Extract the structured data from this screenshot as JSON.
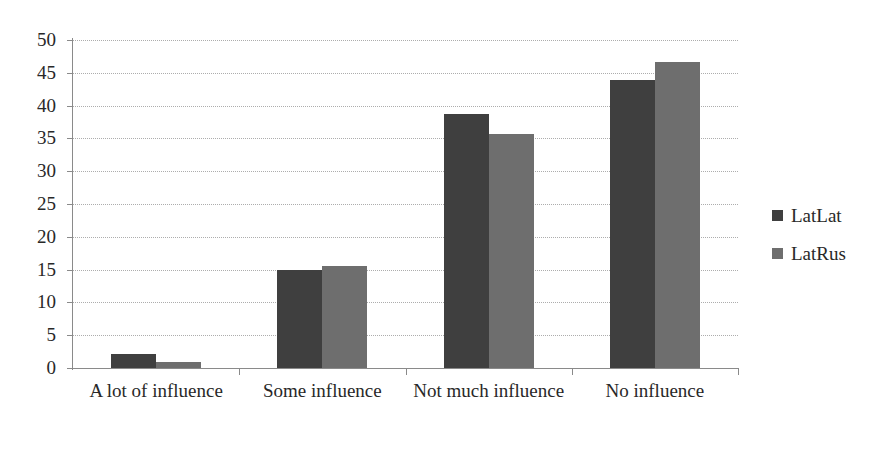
{
  "chart_data": {
    "type": "bar",
    "title": "",
    "subtitle": "",
    "xlabel": "",
    "ylabel": "",
    "categories": [
      "A lot of influence",
      "Some influence",
      "Not much influence",
      "No influence"
    ],
    "series": [
      {
        "name": "LatLat",
        "color": "#3f3f3f",
        "values": [
          2.1,
          15.0,
          38.7,
          43.9
        ]
      },
      {
        "name": "LatRus",
        "color": "#6e6e6e",
        "values": [
          0.9,
          15.6,
          35.6,
          46.6
        ]
      }
    ],
    "ylim": [
      0,
      50
    ],
    "ytick_step": 5,
    "ytick_labels": [
      "0",
      "5",
      "10",
      "15",
      "20",
      "25",
      "30",
      "35",
      "40",
      "45",
      "50"
    ],
    "grid": "horizontal-dotted",
    "legend_position": "right",
    "annotations": []
  },
  "legend": {
    "items": [
      {
        "label": "LatLat"
      },
      {
        "label": "LatRus"
      }
    ]
  }
}
